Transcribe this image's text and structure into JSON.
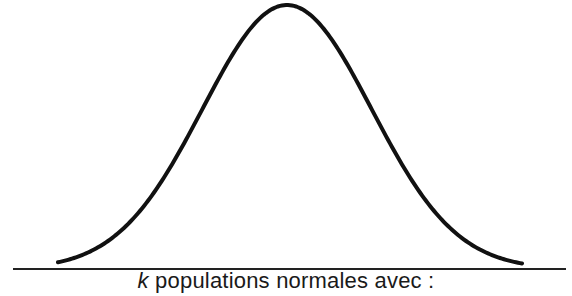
{
  "diagram": {
    "type": "normal-distribution-curve",
    "caption_var": "k",
    "caption_text": " populations normales avec :",
    "colors": {
      "curve": "#111111",
      "axis": "#222222",
      "background": "#ffffff"
    },
    "curve": {
      "mean_x": 287,
      "sigma_px": 84.5,
      "peak_y": 5,
      "baseline_y": 263,
      "x_start": 58,
      "x_end": 523
    },
    "axis": {
      "x1": 13,
      "x2": 566,
      "y": 269
    }
  }
}
